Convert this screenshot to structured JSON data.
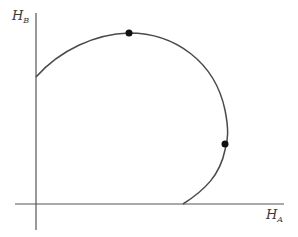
{
  "diagram": {
    "type": "production-possibility-frontier",
    "axes": {
      "y_label": {
        "main": "H",
        "sub": "B"
      },
      "x_label": {
        "main": "H",
        "sub": "A"
      }
    },
    "colors": {
      "axis": "#555555",
      "curve": "#4a4a4a",
      "point": "#111111",
      "background": "#ffffff"
    },
    "curve": {
      "description": "Closed-ish concave frontier starting on the vertical axis, rising to a maximum in H_B, bending around to a maximum in H_A, and returning to meet the horizontal axis",
      "start": [
        36,
        77
      ],
      "end": [
        183,
        204
      ]
    },
    "points": [
      {
        "name": "max-hb-point",
        "x": 129,
        "y": 33
      },
      {
        "name": "max-ha-point",
        "x": 225,
        "y": 144
      }
    ]
  }
}
